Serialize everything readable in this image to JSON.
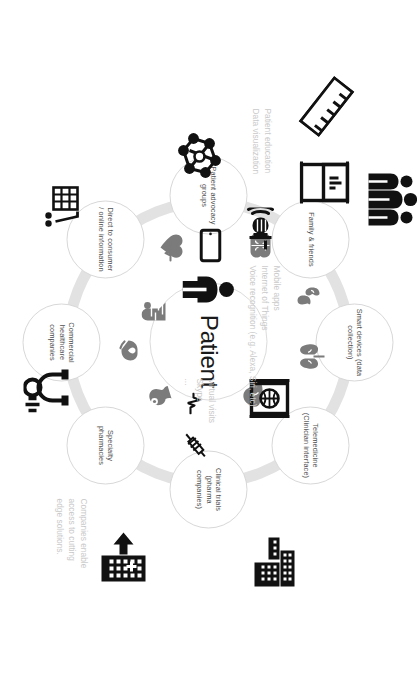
{
  "diagram": {
    "center": {
      "label": "Patient",
      "icon": "patient-person-icon",
      "pulse_icon": "heartbeat-pulse-icon"
    },
    "ring_color": "#e2e2e2",
    "bubble_border_color": "#d8d8d8",
    "annotation_color": "#c9c9c9",
    "nodes": [
      {
        "id": "smart-devices",
        "label": "Smart devices\n(data\ncollection)"
      },
      {
        "id": "telemedicine",
        "label": "Telemedicine\n(Clinician\ninterface)"
      },
      {
        "id": "clinical-trials",
        "label": "Clinical trials\n(pharma\ncompanies)"
      },
      {
        "id": "specialty-pharmacies",
        "label": "Specialty\npharmacies"
      },
      {
        "id": "commercial-healthcare",
        "label": "Commercial\nhealthcare\ncompanies"
      },
      {
        "id": "direct-to-consumer",
        "label": "Direct to\nconsumer /\nonline\ninformation"
      },
      {
        "id": "patient-advocacy",
        "label": "Patient\nadvocacy\ngroups"
      },
      {
        "id": "family-friends",
        "label": "Family &\nfriends"
      }
    ],
    "annotations": [
      {
        "id": "patient-education",
        "text": "Patient education\nData visualization"
      },
      {
        "id": "mobile-tech",
        "text": "Mobile apps\nInternet of Things\nVoice recognition (e.g. Alexa, Siri, etc)"
      },
      {
        "id": "virtual-visits",
        "text": "Virtual visits\nSkype\n..."
      },
      {
        "id": "companies-enable",
        "text": "Companies enable\naccess to cutting\nedge solutions."
      }
    ],
    "icons": [
      {
        "id": "ruler-icon",
        "name": "ruler-icon"
      },
      {
        "id": "monitor-chart-icon",
        "name": "monitor-chart-icon"
      },
      {
        "id": "smart-speaker-icon",
        "name": "smart-speaker-voice-icon"
      },
      {
        "id": "smartphone-icon",
        "name": "smartphone-icon"
      },
      {
        "id": "video-call-icon",
        "name": "video-call-screen-icon"
      },
      {
        "id": "buildings-icon",
        "name": "office-buildings-icon"
      },
      {
        "id": "pharmacy-building-icon",
        "name": "pharmacy-building-icon"
      },
      {
        "id": "store-shelf-icon",
        "name": "retail-shelf-icon"
      },
      {
        "id": "molecule-icon",
        "name": "molecule-structure-icon"
      },
      {
        "id": "people-group-icon",
        "name": "people-group-icon"
      },
      {
        "id": "stethoscope-icon",
        "name": "stethoscope-icon"
      },
      {
        "id": "syringe-icon",
        "name": "syringe-icon"
      },
      {
        "id": "kidneys-icon",
        "name": "kidneys-organ-icon"
      },
      {
        "id": "lungs-icon",
        "name": "lungs-organ-icon"
      },
      {
        "id": "liver-icon",
        "name": "liver-organ-icon"
      },
      {
        "id": "stomach-icon",
        "name": "stomach-organ-icon"
      },
      {
        "id": "heart-icon",
        "name": "heart-organ-icon"
      },
      {
        "id": "brain-icon",
        "name": "brain-organ-icon"
      },
      {
        "id": "intestine-icon",
        "name": "intestine-organ-icon"
      },
      {
        "id": "hand-care-icon",
        "name": "hand-heart-care-icon"
      }
    ]
  }
}
